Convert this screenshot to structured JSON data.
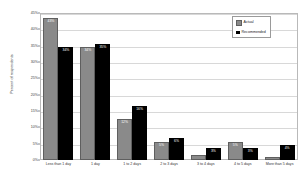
{
  "chart_data": {
    "type": "bar",
    "title": "",
    "xlabel": "",
    "ylabel": "Percent of respondents",
    "ylim": [
      0,
      45
    ],
    "grid": true,
    "legend_position": "top-right",
    "categories": [
      "Less than 1 day",
      "1 day",
      "1 to 2 days",
      "2 to 3 days",
      "3 to 4 days",
      "4 to 5 days",
      "More than 5 days"
    ],
    "ytick_labels": [
      "0%",
      "5%",
      "10%",
      "15%",
      "20%",
      "25%",
      "30%",
      "35%",
      "40%",
      "45%"
    ],
    "ytick_values": [
      0,
      5,
      10,
      15,
      20,
      25,
      30,
      35,
      40,
      45
    ],
    "series": [
      {
        "name": "Actual",
        "color": "#8a8a8a",
        "values": [
          43,
          34,
          12,
          5,
          1,
          5,
          0
        ],
        "labels": [
          "43%",
          "34%",
          "12%",
          "5%",
          "1%",
          "5%",
          "0%"
        ]
      },
      {
        "name": "Recommended",
        "color": "#000000",
        "values": [
          34,
          35,
          16,
          6,
          3,
          3,
          4
        ],
        "labels": [
          "34%",
          "35%",
          "16%",
          "6%",
          "3%",
          "3%",
          "4%"
        ]
      }
    ]
  },
  "legend": {
    "items": [
      {
        "label": "Actual"
      },
      {
        "label": "Recommended"
      }
    ]
  }
}
